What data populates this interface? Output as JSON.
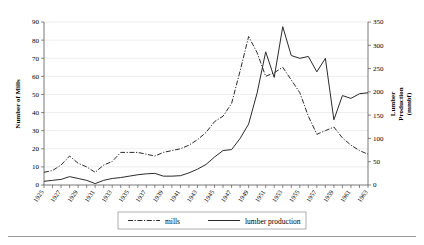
{
  "chart_data": {
    "type": "line",
    "title": "",
    "xlabel": "",
    "ylabel": "Number of Mills",
    "y2label": "Lumber Production (mmbf)",
    "ylim": [
      0,
      90
    ],
    "y2lim": [
      0,
      350
    ],
    "ytick_labels": [
      "0",
      "10",
      "20",
      "30",
      "40",
      "50",
      "60",
      "70",
      "80",
      "90"
    ],
    "y2tick_labels": [
      "0",
      "50",
      "100",
      "150",
      "200",
      "250",
      "300",
      "350"
    ],
    "grid": true,
    "legend_position": "bottom",
    "x": [
      1925,
      1926,
      1927,
      1928,
      1929,
      1930,
      1931,
      1932,
      1933,
      1934,
      1935,
      1936,
      1937,
      1938,
      1939,
      1940,
      1941,
      1942,
      1943,
      1944,
      1945,
      1946,
      1947,
      1948,
      1949,
      1950,
      1951,
      1952,
      1953,
      1954,
      1955,
      1956,
      1957,
      1958,
      1959,
      1960,
      1961,
      1962,
      1963
    ],
    "xtick_labels": [
      "1925",
      "1927",
      "1929",
      "1931",
      "1933",
      "1935",
      "1937",
      "1939",
      "1941",
      "1943",
      "1945",
      "1947",
      "1949",
      "1951",
      "1953",
      "1955",
      "1957",
      "1959",
      "1961",
      "1963"
    ],
    "series": [
      {
        "name": "mills",
        "style": "dash-dot",
        "axis": "left",
        "unit": "mills",
        "values": [
          7,
          8,
          11,
          16,
          12,
          10,
          7,
          11,
          13,
          18,
          18,
          18,
          17,
          16,
          18,
          19,
          20,
          22,
          25,
          29,
          35,
          38,
          45,
          63,
          82,
          73,
          60,
          62,
          65,
          58,
          51,
          38,
          28,
          30,
          32,
          26,
          22,
          19,
          17
        ]
      },
      {
        "name": "lumber production",
        "style": "solid",
        "axis": "right",
        "unit": "mmbf",
        "values": [
          8,
          10,
          12,
          18,
          14,
          10,
          3,
          10,
          14,
          16,
          19,
          22,
          24,
          25,
          19,
          19,
          20,
          26,
          34,
          44,
          60,
          74,
          76,
          100,
          131,
          198,
          286,
          231,
          340,
          278,
          272,
          276,
          243,
          272,
          140,
          192,
          186,
          196,
          198
        ]
      }
    ]
  },
  "legend": {
    "items": [
      {
        "label": "mills",
        "style": "dash-dot"
      },
      {
        "label": "lumber production",
        "style": "solid"
      }
    ]
  }
}
